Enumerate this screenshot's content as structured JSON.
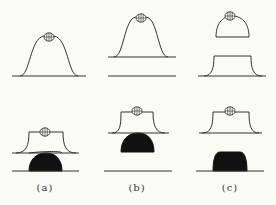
{
  "figure": {
    "colors": {
      "line": "#333333",
      "fill_black": "#111111",
      "background": "#fbfbf6"
    },
    "panels": [
      {
        "id": "a",
        "label": "(a)"
      },
      {
        "id": "b",
        "label": "(b)"
      },
      {
        "id": "c",
        "label": "(c)"
      }
    ]
  }
}
